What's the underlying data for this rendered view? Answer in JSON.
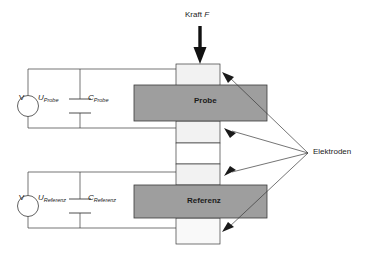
{
  "diagram": {
    "title_force": "Kraft",
    "title_force_symbol": "F",
    "electrodes_label": "Elektroden",
    "blocks": {
      "sample": "Probe",
      "reference": "Referenz"
    },
    "circuits": {
      "upper": {
        "meter": "V",
        "voltage": "U",
        "voltage_sub": "Probe",
        "capacitor": "C",
        "capacitor_sub": "Probe"
      },
      "lower": {
        "meter": "V",
        "voltage": "U",
        "voltage_sub": "Referenz",
        "capacitor": "C",
        "capacitor_sub": "Referenz"
      }
    },
    "colors": {
      "block_fill": "#9e9e9e",
      "electrode_fill": "#f2f2f2",
      "stroke": "#3a3a3a",
      "text": "#1a1a1a"
    }
  }
}
